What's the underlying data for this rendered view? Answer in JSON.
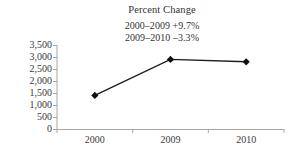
{
  "chart_data": {
    "type": "line",
    "title": "Percent Change",
    "xlabel": "",
    "ylabel": "",
    "categories": [
      "2000",
      "2009",
      "2010"
    ],
    "values": [
      1400,
      2900,
      2800
    ],
    "series": [
      {
        "name": "value",
        "values": [
          1400,
          2900,
          2800
        ]
      }
    ],
    "ylim": [
      0,
      3500
    ],
    "yticks": [
      0,
      500,
      1000,
      1500,
      2000,
      2500,
      3000,
      3500
    ],
    "ytick_labels": [
      "0",
      "500",
      "1,000",
      "1,500",
      "2,000",
      "2,500",
      "3,000",
      "3,500"
    ],
    "xtick_labels": [
      "2000",
      "2009",
      "2010"
    ],
    "grid": false,
    "legend": "none",
    "marker": "diamond",
    "annotations": [
      "2000–2009 +9.7%",
      "2009–2010 –3.3%"
    ],
    "colors": {
      "line": "#1d1d1d",
      "marker": "#111111",
      "axis": "#a6a6a6",
      "text": "#3a3a3a"
    }
  }
}
